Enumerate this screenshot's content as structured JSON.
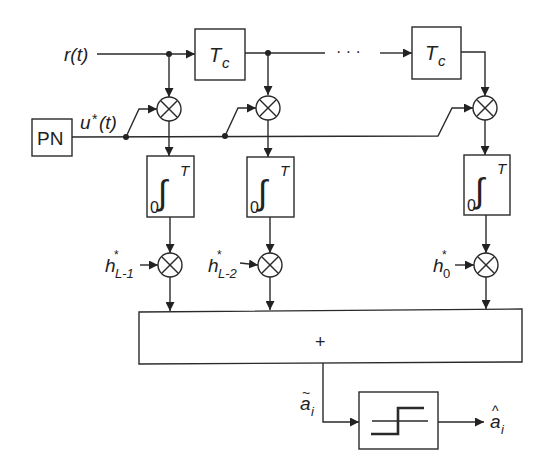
{
  "diagram": {
    "input_signal": "r(t)",
    "pn_generator": {
      "label": "PN"
    },
    "spreading_code": {
      "base": "u",
      "sup": "*",
      "arg": "(t)"
    },
    "delay_elements": [
      {
        "label_base": "T",
        "label_sub": "c"
      },
      {
        "label_base": "T",
        "label_sub": "c"
      }
    ],
    "ellipsis": "· · ·",
    "multipliers_symbol": "⊗",
    "integrators": [
      {
        "lower": "0",
        "upper": "T",
        "symbol": "∫"
      },
      {
        "lower": "0",
        "upper": "T",
        "symbol": "∫"
      },
      {
        "lower": "0",
        "upper": "T",
        "symbol": "∫"
      }
    ],
    "weights": [
      {
        "base": "h",
        "sup": "*",
        "sub": "L-1"
      },
      {
        "base": "h",
        "sup": "*",
        "sub": "L-2"
      },
      {
        "base": "h",
        "sup": "*",
        "sub": "0"
      }
    ],
    "summer": {
      "label": "+"
    },
    "decision_input": {
      "base": "a",
      "accent": "~",
      "sub": "i"
    },
    "decision_output": {
      "base": "a",
      "accent": "^",
      "sub": "i"
    },
    "decision_device": {
      "type": "hard-limiter"
    },
    "colors": {
      "line": "#2a2a2a",
      "background": "#ffffff"
    }
  }
}
